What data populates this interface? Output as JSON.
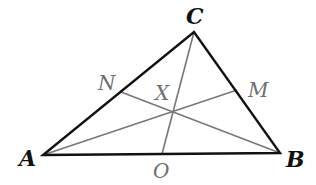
{
  "diagram": {
    "type": "triangle with cevians",
    "colors": {
      "sides": "#111111",
      "cevians": "#777777",
      "point_labels": "#6e6e6e"
    },
    "vertices": {
      "A": {
        "label": "A",
        "x": 43,
        "y": 155
      },
      "B": {
        "label": "B",
        "x": 280,
        "y": 153
      },
      "C": {
        "label": "C",
        "x": 194,
        "y": 32
      }
    },
    "side_points": {
      "N": {
        "label": "N",
        "on": "AC",
        "x": 121,
        "y": 92
      },
      "M": {
        "label": "M",
        "on": "BC",
        "x": 237,
        "y": 90
      },
      "O": {
        "label": "O",
        "on": "AB",
        "x": 162,
        "y": 154
      }
    },
    "intersection": {
      "label": "X",
      "x": 173,
      "y": 112
    },
    "cevians": [
      "CO",
      "AM",
      "BN"
    ]
  }
}
